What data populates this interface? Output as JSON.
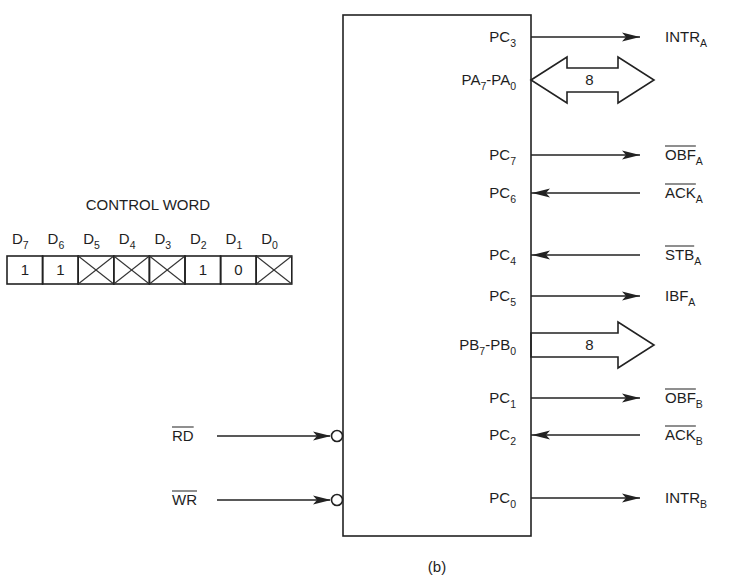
{
  "figure_caption": "(b)",
  "control_word": {
    "title": "CONTROL WORD",
    "bits": [
      {
        "name": "D",
        "index": "7",
        "value": "1",
        "dont_care": false
      },
      {
        "name": "D",
        "index": "6",
        "value": "1",
        "dont_care": false
      },
      {
        "name": "D",
        "index": "5",
        "value": "",
        "dont_care": true
      },
      {
        "name": "D",
        "index": "4",
        "value": "",
        "dont_care": true
      },
      {
        "name": "D",
        "index": "3",
        "value": "",
        "dont_care": true
      },
      {
        "name": "D",
        "index": "2",
        "value": "1",
        "dont_care": false
      },
      {
        "name": "D",
        "index": "1",
        "value": "0",
        "dont_care": false
      },
      {
        "name": "D",
        "index": "0",
        "value": "",
        "dont_care": true
      }
    ]
  },
  "inputs_left": [
    {
      "label": "RD",
      "overbar": true,
      "y": 436,
      "active_low": true
    },
    {
      "label": "WR",
      "overbar": true,
      "y": 500,
      "active_low": true
    }
  ],
  "ports": [
    {
      "pin": "PC",
      "pin_sub": "3",
      "signal": "INTR",
      "signal_sub": "A",
      "overbar": false,
      "direction": "out",
      "y": 37
    },
    {
      "pin": "PA",
      "pin_sub": "7",
      "pin2": "PA",
      "pin2_sub": "0",
      "bus_width": "8",
      "direction": "bidirectional",
      "y": 80
    },
    {
      "pin": "PC",
      "pin_sub": "7",
      "signal": "OBF",
      "signal_sub": "A",
      "overbar": true,
      "direction": "out",
      "y": 155
    },
    {
      "pin": "PC",
      "pin_sub": "6",
      "signal": "ACK",
      "signal_sub": "A",
      "overbar": true,
      "direction": "in",
      "y": 193
    },
    {
      "pin": "PC",
      "pin_sub": "4",
      "signal": "STB",
      "signal_sub": "A",
      "overbar": true,
      "direction": "in",
      "y": 255
    },
    {
      "pin": "PC",
      "pin_sub": "5",
      "signal": "IBF",
      "signal_sub": "A",
      "overbar": false,
      "direction": "out",
      "y": 296
    },
    {
      "pin": "PB",
      "pin_sub": "7",
      "pin2": "PB",
      "pin2_sub": "0",
      "bus_width": "8",
      "direction": "out",
      "y": 345
    },
    {
      "pin": "PC",
      "pin_sub": "1",
      "signal": "OBF",
      "signal_sub": "B",
      "overbar": true,
      "direction": "out",
      "y": 398
    },
    {
      "pin": "PC",
      "pin_sub": "2",
      "signal": "ACK",
      "signal_sub": "B",
      "overbar": true,
      "direction": "in",
      "y": 435
    },
    {
      "pin": "PC",
      "pin_sub": "0",
      "signal": "INTR",
      "signal_sub": "B",
      "overbar": false,
      "direction": "out",
      "y": 498
    }
  ]
}
